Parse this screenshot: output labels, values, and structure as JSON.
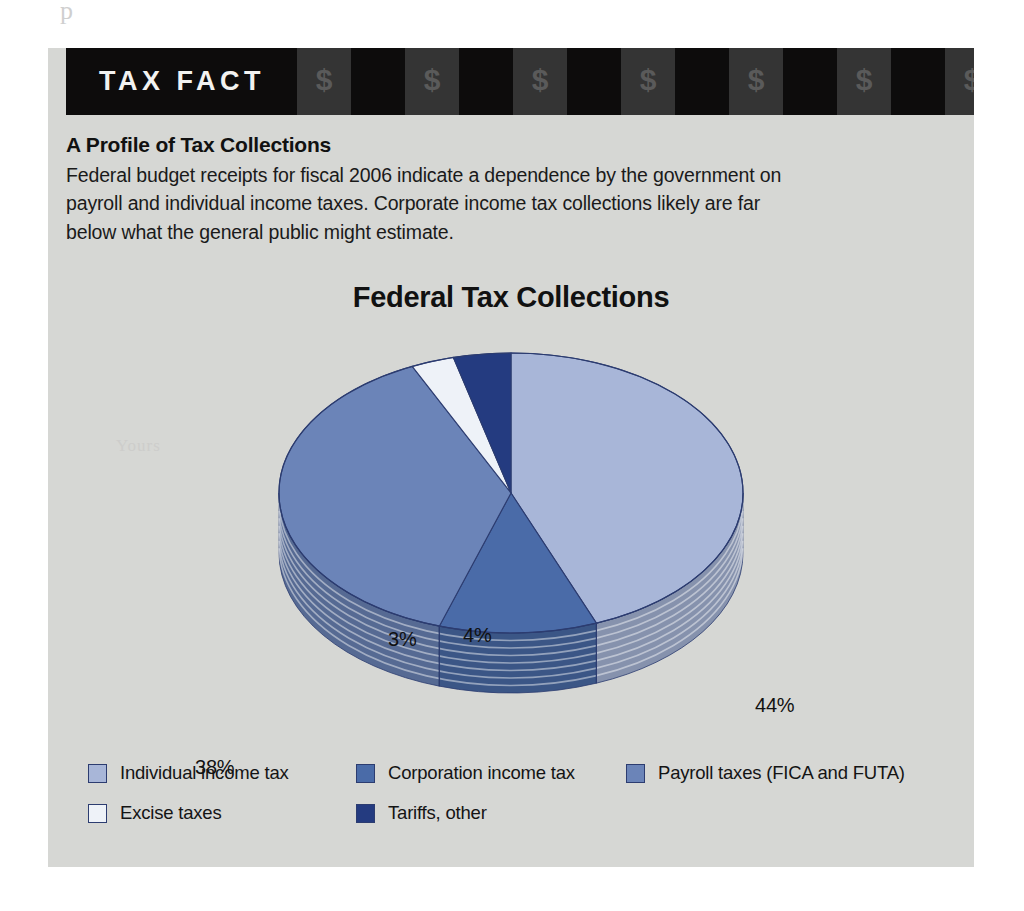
{
  "banner": {
    "title": "TAX FACT",
    "dollar_symbol": "$",
    "block_count": 13
  },
  "intro": {
    "heading": "A Profile of Tax Collections",
    "body": "Federal budget receipts for fiscal 2006 indicate a dependence by the government on payroll and individual income taxes. Corporate income tax collections likely are far below what the general public might estimate."
  },
  "colors": {
    "card_bg": "#d6d7d4",
    "banner_bg": "#0d0c0c",
    "banner_block_gray": "#343434",
    "individual": "#a8b6d8",
    "corporation": "#4a6ba8",
    "payroll": "#6b84b8",
    "excise": "#eef2f8",
    "tariffs": "#243b80",
    "slice_outline": "#2c3c70"
  },
  "chart_data": {
    "type": "pie",
    "title": "Federal Tax Collections",
    "xlabel": "",
    "ylabel": "",
    "unit": "%",
    "legend_position": "bottom",
    "grid": false,
    "three_d": true,
    "categories": [
      "Individual income tax",
      "Corporation income tax",
      "Payroll taxes (FICA and FUTA)",
      "Excise taxes",
      "Tariffs, other"
    ],
    "values": [
      44,
      11,
      38,
      3,
      4
    ],
    "labels": [
      "44%",
      "11%",
      "38%",
      "3%",
      "4%"
    ],
    "slice_colors": [
      "#a8b6d8",
      "#4a6ba8",
      "#6b84b8",
      "#eef2f8",
      "#243b80"
    ],
    "legend": [
      {
        "label": "Individual income tax",
        "color": "#a8b6d8",
        "value": 44
      },
      {
        "label": "Corporation income tax",
        "color": "#4a6ba8",
        "value": 11
      },
      {
        "label": "Payroll taxes (FICA and FUTA)",
        "color": "#6b84b8",
        "value": 38
      },
      {
        "label": "Excise taxes",
        "color": "#eef2f8",
        "value": 3
      },
      {
        "label": "Tariffs, other",
        "color": "#243b80",
        "value": 4
      }
    ]
  },
  "artifacts": {
    "top_scan": "p",
    "side_scan": "Yours"
  }
}
